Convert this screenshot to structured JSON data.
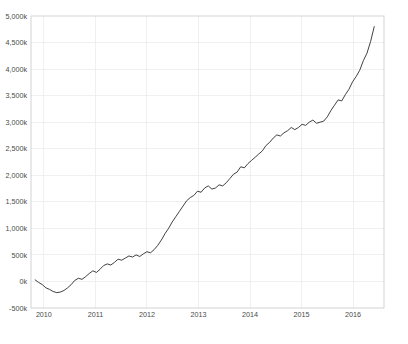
{
  "chart_data": {
    "type": "line",
    "title": "",
    "subtitle": "",
    "xlabel": "",
    "ylabel": "",
    "grid": true,
    "legend_position": "none",
    "xlim": [
      2009.75,
      2016.6
    ],
    "ylim": [
      -500,
      5000
    ],
    "y_unit": "k",
    "x_tick_labels": [
      "2010",
      "2011",
      "2012",
      "2013",
      "2014",
      "2015",
      "2016"
    ],
    "x_ticks": [
      2010,
      2011,
      2012,
      2013,
      2014,
      2015,
      2016
    ],
    "y_tick_labels": [
      "5,000k",
      "4,500k",
      "4,000k",
      "3,500k",
      "3,000k",
      "2,500k",
      "2,000k",
      "1,500k",
      "1,000k",
      "500k",
      "0k",
      "-500k"
    ],
    "y_ticks": [
      5000,
      4500,
      4000,
      3500,
      3000,
      2500,
      2000,
      1500,
      1000,
      500,
      0,
      -500
    ],
    "series": [
      {
        "name": "cumulative total",
        "color": "#2b2b2b",
        "x": [
          2009.83,
          2009.9,
          2009.97,
          2010.04,
          2010.11,
          2010.18,
          2010.25,
          2010.32,
          2010.39,
          2010.46,
          2010.53,
          2010.6,
          2010.67,
          2010.74,
          2010.81,
          2010.88,
          2010.95,
          2011.02,
          2011.09,
          2011.16,
          2011.23,
          2011.3,
          2011.37,
          2011.44,
          2011.51,
          2011.58,
          2011.65,
          2011.72,
          2011.79,
          2011.86,
          2011.93,
          2012.0,
          2012.07,
          2012.14,
          2012.21,
          2012.28,
          2012.35,
          2012.42,
          2012.49,
          2012.56,
          2012.63,
          2012.7,
          2012.77,
          2012.84,
          2012.91,
          2012.98,
          2013.05,
          2013.12,
          2013.19,
          2013.26,
          2013.33,
          2013.4,
          2013.47,
          2013.54,
          2013.61,
          2013.68,
          2013.75,
          2013.82,
          2013.89,
          2013.96,
          2014.03,
          2014.1,
          2014.17,
          2014.24,
          2014.31,
          2014.38,
          2014.45,
          2014.52,
          2014.59,
          2014.66,
          2014.73,
          2014.8,
          2014.87,
          2014.94,
          2015.01,
          2015.08,
          2015.15,
          2015.22,
          2015.29,
          2015.36,
          2015.43,
          2015.5,
          2015.57,
          2015.64,
          2015.71,
          2015.78,
          2015.85,
          2015.92,
          2015.99,
          2016.06,
          2016.13,
          2016.2,
          2016.27,
          2016.34,
          2016.41
        ],
        "y": [
          30,
          -20,
          -60,
          -120,
          -150,
          -190,
          -210,
          -200,
          -170,
          -120,
          -60,
          20,
          60,
          40,
          90,
          150,
          200,
          170,
          230,
          300,
          330,
          310,
          360,
          420,
          400,
          440,
          480,
          460,
          500,
          470,
          520,
          560,
          540,
          600,
          680,
          780,
          900,
          1000,
          1120,
          1220,
          1320,
          1420,
          1520,
          1580,
          1620,
          1700,
          1680,
          1760,
          1800,
          1740,
          1760,
          1820,
          1800,
          1860,
          1940,
          2020,
          2060,
          2160,
          2140,
          2220,
          2280,
          2340,
          2400,
          2460,
          2560,
          2620,
          2700,
          2760,
          2740,
          2800,
          2840,
          2900,
          2860,
          2900,
          2960,
          2940,
          3000,
          3040,
          2980,
          3000,
          3020,
          3100,
          3220,
          3320,
          3420,
          3400,
          3520,
          3620,
          3760,
          3860,
          3980,
          4160,
          4300,
          4520,
          4800
        ]
      }
    ]
  },
  "plot": {
    "x_left": 31,
    "x_right": 384,
    "y_top": 16,
    "y_bottom": 308
  }
}
